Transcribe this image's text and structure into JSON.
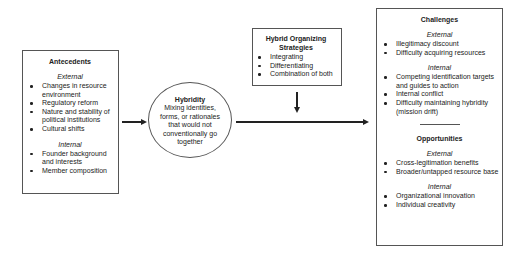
{
  "antecedents": {
    "title": "Antecedents",
    "external": {
      "label": "External",
      "items": [
        "Changes in resource environment",
        "Regulatory reform",
        "Nature and stability of political institutions",
        "Cultural shifts"
      ]
    },
    "internal": {
      "label": "Internal",
      "items": [
        "Founder background and interests",
        "Member composition"
      ]
    }
  },
  "hybridity": {
    "title": "Hybridity",
    "description": "Mixing identities, forms, or rationales that would not conventionally go together"
  },
  "strategies": {
    "title": "Hybrid Organizing Strategies",
    "items": [
      "Integrating",
      "Differentiating",
      "Combination of both"
    ]
  },
  "outcomes": {
    "challenges": {
      "title": "Challenges",
      "external": {
        "label": "External",
        "items": [
          "Illegitimacy discount",
          "Difficulty acquiring resources"
        ]
      },
      "internal": {
        "label": "Internal",
        "items": [
          "Competing identification targets and guides to action",
          "Internal conflict",
          "Difficulty maintaining hybridity (mission drift)"
        ]
      }
    },
    "opportunities": {
      "title": "Opportunities",
      "external": {
        "label": "External",
        "items": [
          "Cross-legitimation benefits",
          "Broader/untapped resource base"
        ]
      },
      "internal": {
        "label": "Internal",
        "items": [
          "Organizational innovation",
          "Individual creativity"
        ]
      }
    }
  },
  "connectors": [
    {
      "from": "antecedents",
      "to": "hybridity",
      "direction": "right"
    },
    {
      "from": "hybridity",
      "to": "outcomes",
      "direction": "right"
    },
    {
      "from": "strategies",
      "to": "hybridity-outcomes-link",
      "direction": "down"
    }
  ]
}
